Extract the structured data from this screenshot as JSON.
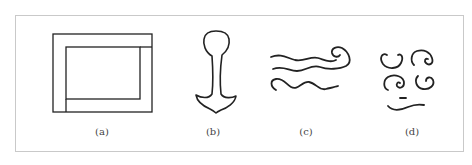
{
  "figure": {
    "panels": [
      {
        "id": "a",
        "caption": "(a)",
        "description": "nested rectangles"
      },
      {
        "id": "b",
        "caption": "(b)",
        "description": "anchor-like outline shape"
      },
      {
        "id": "c",
        "caption": "(c)",
        "description": "wavy lines with curl"
      },
      {
        "id": "d",
        "caption": "(d)",
        "description": "spiral curls with dash and wave"
      }
    ]
  }
}
